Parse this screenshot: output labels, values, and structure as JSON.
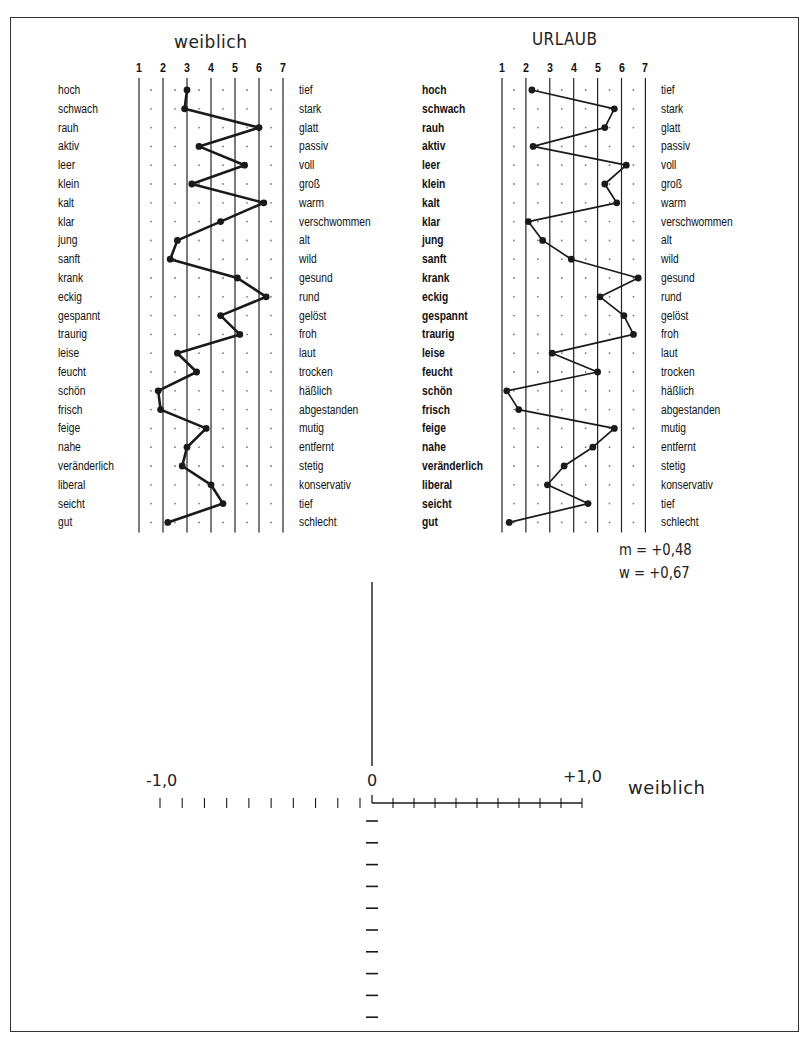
{
  "chart_data": [
    {
      "type": "line",
      "title": "weiblich",
      "scale": [
        1,
        2,
        3,
        4,
        5,
        6,
        7
      ],
      "xlim": [
        1,
        7
      ],
      "left_labels": [
        "hoch",
        "schwach",
        "rauh",
        "aktiv",
        "leer",
        "klein",
        "kalt",
        "klar",
        "jung",
        "sanft",
        "krank",
        "eckig",
        "gespannt",
        "traurig",
        "leise",
        "feucht",
        "schön",
        "frisch",
        "feige",
        "nahe",
        "veränderlich",
        "liberal",
        "seicht",
        "gut"
      ],
      "right_labels": [
        "tief",
        "stark",
        "glatt",
        "passiv",
        "voll",
        "groß",
        "warm",
        "verschwommen",
        "alt",
        "wild",
        "gesund",
        "rund",
        "gelöst",
        "froh",
        "laut",
        "trocken",
        "häßlich",
        "abgestanden",
        "mutig",
        "entfernt",
        "stetig",
        "konservativ",
        "tief",
        "schlecht"
      ],
      "values": [
        3.0,
        2.9,
        6.0,
        3.5,
        5.4,
        3.2,
        6.2,
        4.4,
        2.6,
        2.3,
        5.1,
        6.3,
        4.4,
        5.2,
        2.6,
        3.4,
        1.8,
        1.9,
        3.8,
        3.0,
        2.8,
        4.0,
        4.5,
        2.2
      ],
      "grid": true
    },
    {
      "type": "line",
      "title": "URLAUB",
      "scale": [
        1,
        2,
        3,
        4,
        5,
        6,
        7
      ],
      "xlim": [
        1,
        7
      ],
      "left_labels": [
        "hoch",
        "schwach",
        "rauh",
        "aktiv",
        "leer",
        "klein",
        "kalt",
        "klar",
        "jung",
        "sanft",
        "krank",
        "eckig",
        "gespannt",
        "traurig",
        "leise",
        "feucht",
        "schön",
        "frisch",
        "feige",
        "nahe",
        "veränderlich",
        "liberal",
        "seicht",
        "gut"
      ],
      "right_labels": [
        "tief",
        "stark",
        "glatt",
        "passiv",
        "voll",
        "groß",
        "warm",
        "verschwommen",
        "alt",
        "wild",
        "gesund",
        "rund",
        "gelöst",
        "froh",
        "laut",
        "trocken",
        "häßlich",
        "abgestanden",
        "mutig",
        "entfernt",
        "stetig",
        "konservativ",
        "tief",
        "schlecht"
      ],
      "values": [
        2.25,
        5.7,
        5.3,
        2.3,
        6.2,
        5.3,
        5.8,
        2.1,
        2.7,
        3.9,
        6.7,
        5.1,
        6.1,
        6.5,
        3.1,
        5.0,
        1.2,
        1.7,
        5.7,
        4.8,
        3.6,
        2.9,
        4.6,
        1.3
      ],
      "grid": true,
      "annotations": [
        "m = +0,48",
        "w = +0,67"
      ]
    },
    {
      "type": "scatter",
      "title": "",
      "xlabel": "weiblich",
      "xlim": [
        -1.0,
        1.0
      ],
      "x_tick_labels": [
        "-1,0",
        "0",
        "+1,0"
      ],
      "x_ticks_per_side": 10,
      "y_ticks_below": 10,
      "points": []
    }
  ],
  "panels": {
    "left": {
      "title": "weiblich"
    },
    "right": {
      "title": "URLAUB"
    }
  },
  "stats": {
    "m": "m = +0,48",
    "w": "w = +0,67"
  },
  "cross": {
    "neg_label": "-1,0",
    "zero_label": "0",
    "pos_label": "+1,0",
    "axis_title": "weiblich"
  },
  "colors": {
    "ink": "#1a1a1a",
    "grid": "#222222",
    "dot": "#777777",
    "background": "#ffffff"
  }
}
